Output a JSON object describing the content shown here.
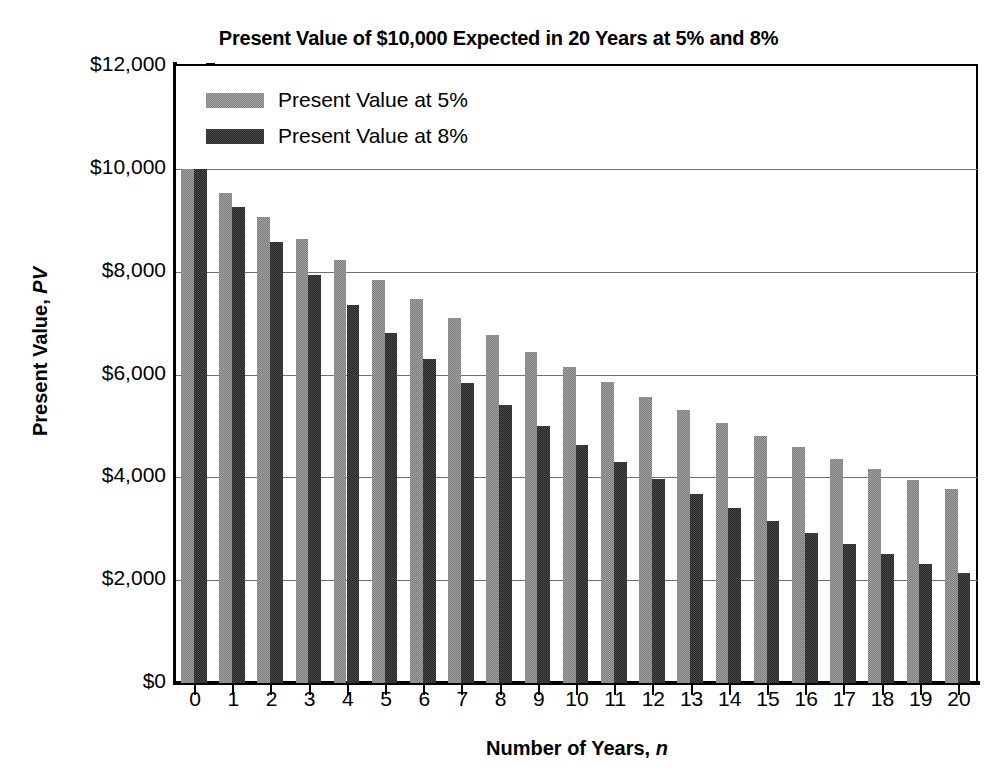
{
  "chart_data": {
    "type": "bar",
    "title": "Present Value of $10,000 Expected in 20 Years at 5% and 8%",
    "xlabel": "Number of Years, n",
    "xlabel_plain": "Number of Years, ",
    "xlabel_italic": "n",
    "ylabel": "Present Value, PV",
    "ylabel_plain": "Present Value, ",
    "ylabel_italic": "PV",
    "grid": true,
    "legend_position": "top-left-inside",
    "ylim": [
      0,
      12000
    ],
    "ytick_labels": [
      "$12,000",
      "$10,000",
      "$8,000",
      "$6,000",
      "$4,000",
      "$2,000",
      "$0"
    ],
    "ytick_values": [
      12000,
      10000,
      8000,
      6000,
      4000,
      2000,
      0
    ],
    "categories": [
      "0",
      "1",
      "2",
      "3",
      "4",
      "5",
      "6",
      "7",
      "8",
      "9",
      "10",
      "11",
      "12",
      "13",
      "14",
      "15",
      "16",
      "17",
      "18",
      "19",
      "20"
    ],
    "x": [
      0,
      1,
      2,
      3,
      4,
      5,
      6,
      7,
      8,
      9,
      10,
      11,
      12,
      13,
      14,
      15,
      16,
      17,
      18,
      19,
      20
    ],
    "series": [
      {
        "name": "Present Value at 5%",
        "color": "#7d7d7d",
        "values": [
          10000,
          9524,
          9070,
          8638,
          8227,
          7835,
          7462,
          7107,
          6768,
          6446,
          6139,
          5847,
          5568,
          5303,
          5051,
          4810,
          4581,
          4363,
          4155,
          3957,
          3769
        ]
      },
      {
        "name": "Present Value at 8%",
        "color": "#262626",
        "values": [
          10000,
          9259,
          8573,
          7938,
          7350,
          6806,
          6302,
          5835,
          5403,
          5002,
          4632,
          4289,
          3971,
          3677,
          3405,
          3152,
          2919,
          2703,
          2502,
          2317,
          2145
        ]
      }
    ]
  }
}
